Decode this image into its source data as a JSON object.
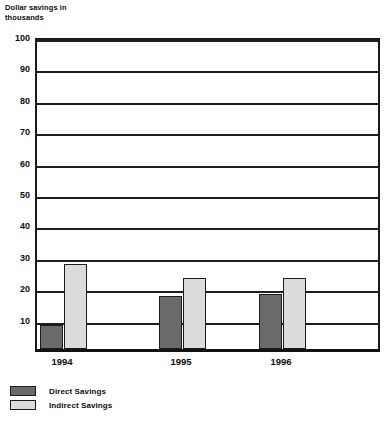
{
  "chart_data": {
    "type": "bar",
    "title": "",
    "subtitle": "",
    "xlabel": "",
    "ylabel": "Dollar savings in thousands",
    "categories": [
      "1994",
      "1995",
      "1996"
    ],
    "series": [
      {
        "name": "Direct Savings",
        "color": "#6a6a6a",
        "values": [
          7.5,
          17,
          17.5
        ]
      },
      {
        "name": "Indirect Savings",
        "color": "#dcdcdc",
        "values": [
          27,
          22.5,
          22.5
        ]
      }
    ],
    "ylim": [
      0,
      100
    ],
    "ytick_step": 10,
    "ytick_labels": [
      "10",
      "20",
      "30",
      "40",
      "50",
      "60",
      "70",
      "80",
      "90",
      "100"
    ],
    "grid": "horizontal",
    "legend_position": "bottom-left"
  },
  "legend": {
    "entries": [
      {
        "label": "Direct Savings",
        "swatch": "direct"
      },
      {
        "label": "Indirect Savings",
        "swatch": "indirect"
      }
    ]
  }
}
